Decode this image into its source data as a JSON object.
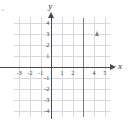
{
  "figure": {
    "background_color": "#ffffff",
    "grid_color": "#d9d9dd",
    "axis_color": "#4a4a4f",
    "line_color": "#7b7b84",
    "x_axis_name": "x",
    "y_axis_name": "y"
  },
  "chart_data": {
    "type": "line",
    "title": "",
    "xlabel": "x",
    "ylabel": "y",
    "xlim": [
      -3.5,
      5.5
    ],
    "ylim": [
      -4.5,
      4.5
    ],
    "grid": true,
    "grid_step": 1,
    "legend": "none",
    "x_ticks": [
      -3,
      -2,
      -1,
      1,
      2,
      4,
      5
    ],
    "x_tick_labels": [
      "-3",
      "-2",
      "-1",
      "1",
      "2",
      "4",
      "5"
    ],
    "y_ticks": [
      4,
      3,
      2,
      1,
      -1,
      -2,
      -3,
      -4
    ],
    "y_tick_labels": [
      "4",
      "3",
      "2",
      "1",
      "-1",
      "-2",
      "-3",
      "-4"
    ],
    "series": [
      {
        "name": "x = 3",
        "equation": "x = 3",
        "orientation": "vertical",
        "x": 3,
        "y_from": -4.5,
        "y_to": 4.4,
        "arrow_top": true,
        "arrow_bottom": false
      }
    ]
  }
}
